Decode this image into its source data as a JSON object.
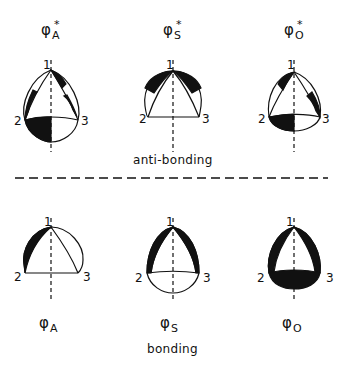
{
  "figure": {
    "sections": {
      "anti_bonding": {
        "caption": "anti-bonding",
        "orbitals": [
          {
            "symbol": "φ",
            "subscript": "A",
            "superscript": "*",
            "name": "phi-A-star"
          },
          {
            "symbol": "φ",
            "subscript": "S",
            "superscript": "*",
            "name": "phi-S-star"
          },
          {
            "symbol": "φ",
            "subscript": "O",
            "superscript": "*",
            "name": "phi-O-star"
          }
        ]
      },
      "bonding": {
        "caption": "bonding",
        "orbitals": [
          {
            "symbol": "φ",
            "subscript": "A",
            "superscript": "",
            "name": "phi-A"
          },
          {
            "symbol": "φ",
            "subscript": "S",
            "superscript": "",
            "name": "phi-S"
          },
          {
            "symbol": "φ",
            "subscript": "O",
            "superscript": "",
            "name": "phi-O"
          }
        ]
      }
    },
    "vertex_labels": [
      "1",
      "2",
      "3"
    ],
    "colors": {
      "ink": "#111111",
      "background": "#ffffff"
    }
  }
}
